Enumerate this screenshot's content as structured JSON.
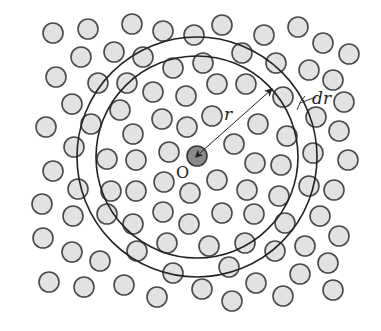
{
  "diagram": {
    "colors": {
      "background": "#ffffff",
      "particle_fill": "#e2e2e2",
      "particle_stroke": "#4a4a4a",
      "center_fill": "#8a8a8a",
      "ring_stroke": "#222222"
    },
    "center": {
      "x": 197,
      "y": 156,
      "r": 10,
      "label": "O",
      "label_x": 176,
      "label_y": 178
    },
    "rings": [
      {
        "name": "inner-shell",
        "cx": 197,
        "cy": 157,
        "r": 101
      },
      {
        "name": "outer-shell",
        "cx": 197,
        "cy": 157,
        "r": 120
      }
    ],
    "radius_arrow": {
      "x1": 197,
      "y1": 156,
      "x2": 272,
      "y2": 89,
      "label": "r",
      "label_x": 224,
      "label_y": 120
    },
    "dr_marker": {
      "label": "dr",
      "label_x": 312,
      "label_y": 104
    },
    "particle_radius": 10,
    "particles": [
      [
        53,
        33
      ],
      [
        88,
        29
      ],
      [
        132,
        24
      ],
      [
        163,
        31
      ],
      [
        194,
        35
      ],
      [
        222,
        25
      ],
      [
        264,
        35
      ],
      [
        298,
        27
      ],
      [
        323,
        43
      ],
      [
        349,
        54
      ],
      [
        81,
        57
      ],
      [
        114,
        52
      ],
      [
        143,
        57
      ],
      [
        173,
        68
      ],
      [
        203,
        63
      ],
      [
        242,
        53
      ],
      [
        276,
        63
      ],
      [
        309,
        70
      ],
      [
        333,
        80
      ],
      [
        56,
        77
      ],
      [
        98,
        83
      ],
      [
        127,
        83
      ],
      [
        153,
        92
      ],
      [
        186,
        96
      ],
      [
        217,
        84
      ],
      [
        246,
        84
      ],
      [
        283,
        97
      ],
      [
        344,
        102
      ],
      [
        72,
        104
      ],
      [
        120,
        110
      ],
      [
        162,
        119
      ],
      [
        187,
        127
      ],
      [
        212,
        116
      ],
      [
        258,
        124
      ],
      [
        287,
        136
      ],
      [
        316,
        117
      ],
      [
        339,
        131
      ],
      [
        46,
        127
      ],
      [
        91,
        124
      ],
      [
        133,
        134
      ],
      [
        234,
        144
      ],
      [
        313,
        153
      ],
      [
        348,
        160
      ],
      [
        74,
        147
      ],
      [
        107,
        159
      ],
      [
        136,
        160
      ],
      [
        169,
        152
      ],
      [
        255,
        163
      ],
      [
        281,
        165
      ],
      [
        53,
        171
      ],
      [
        164,
        182
      ],
      [
        217,
        180
      ],
      [
        309,
        186
      ],
      [
        334,
        190
      ],
      [
        78,
        189
      ],
      [
        111,
        191
      ],
      [
        136,
        191
      ],
      [
        190,
        193
      ],
      [
        247,
        190
      ],
      [
        279,
        196
      ],
      [
        42,
        204
      ],
      [
        73,
        216
      ],
      [
        107,
        214
      ],
      [
        163,
        212
      ],
      [
        222,
        213
      ],
      [
        254,
        214
      ],
      [
        285,
        223
      ],
      [
        320,
        216
      ],
      [
        133,
        224
      ],
      [
        189,
        224
      ],
      [
        339,
        236
      ],
      [
        43,
        238
      ],
      [
        167,
        243
      ],
      [
        209,
        246
      ],
      [
        245,
        243
      ],
      [
        275,
        251
      ],
      [
        305,
        246
      ],
      [
        72,
        252
      ],
      [
        100,
        261
      ],
      [
        137,
        251
      ],
      [
        328,
        263
      ],
      [
        173,
        273
      ],
      [
        229,
        267
      ],
      [
        300,
        274
      ],
      [
        49,
        282
      ],
      [
        84,
        287
      ],
      [
        124,
        285
      ],
      [
        202,
        289
      ],
      [
        256,
        283
      ],
      [
        333,
        290
      ],
      [
        157,
        297
      ],
      [
        232,
        301
      ],
      [
        283,
        296
      ]
    ]
  }
}
